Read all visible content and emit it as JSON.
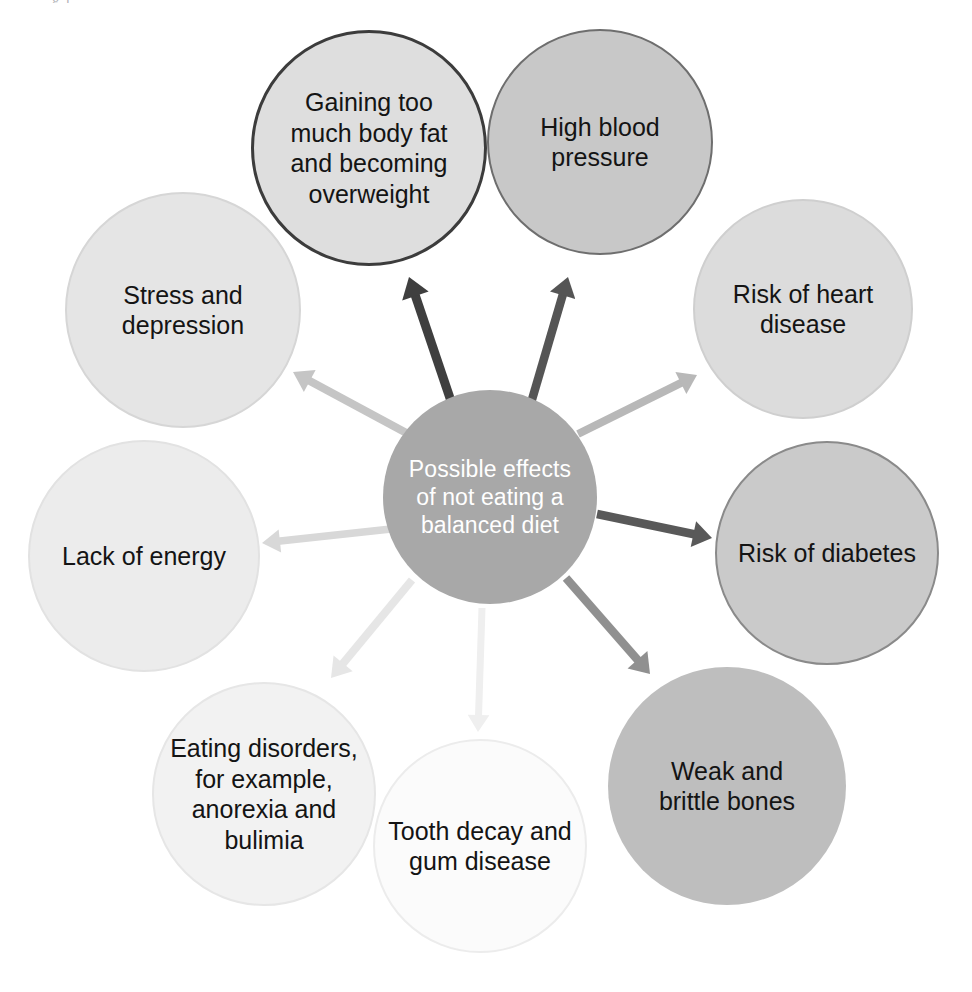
{
  "page": {
    "background": "#ffffff",
    "width": 972,
    "height": 992,
    "top_remnant": "g                                                              ı"
  },
  "diagram": {
    "type": "radial-mind-map",
    "title": "Possible effects of not eating a balanced diet",
    "center": {
      "id": "center",
      "label": "Possible effects\nof not eating a\nbalanced diet",
      "cx": 490,
      "cy": 497,
      "r": 107,
      "fill": "#a8a8a8",
      "stroke": "#a8a8a8",
      "stroke_width": 0,
      "text_color": "#ffffff",
      "font_size": 23
    },
    "nodes": [
      {
        "id": "gaining-weight",
        "label": "Gaining too\nmuch body fat\nand becoming\noverweight",
        "cx": 369,
        "cy": 148,
        "r": 118,
        "fill": "#dedede",
        "stroke": "#3c3c3c",
        "stroke_width": 3,
        "text_color": "#141414",
        "font_size": 25
      },
      {
        "id": "high-blood-pressure",
        "label": "High blood\npressure",
        "cx": 600,
        "cy": 142,
        "r": 113,
        "fill": "#c8c8c8",
        "stroke": "#6e6e6e",
        "stroke_width": 2,
        "text_color": "#141414",
        "font_size": 25
      },
      {
        "id": "heart-disease",
        "label": "Risk of heart\ndisease",
        "cx": 803,
        "cy": 309,
        "r": 110,
        "fill": "#dcdcdc",
        "stroke": "#cfcfcf",
        "stroke_width": 2,
        "text_color": "#141414",
        "font_size": 25
      },
      {
        "id": "diabetes",
        "label": "Risk of diabetes",
        "cx": 827,
        "cy": 553,
        "r": 112,
        "fill": "#cacaca",
        "stroke": "#8a8a8a",
        "stroke_width": 2,
        "text_color": "#141414",
        "font_size": 25
      },
      {
        "id": "brittle-bones",
        "label": "Weak and\nbrittle bones",
        "cx": 727,
        "cy": 786,
        "r": 119,
        "fill": "#bebebe",
        "stroke": "#bebebe",
        "stroke_width": 0,
        "text_color": "#141414",
        "font_size": 25
      },
      {
        "id": "tooth-decay",
        "label": "Tooth decay and\ngum disease",
        "cx": 480,
        "cy": 846,
        "r": 107,
        "fill": "#fbfbfb",
        "stroke": "#ececec",
        "stroke_width": 2,
        "text_color": "#141414",
        "font_size": 25
      },
      {
        "id": "eating-disorders",
        "label": "Eating disorders,\nfor example,\nanorexia and\nbulimia",
        "cx": 264,
        "cy": 794,
        "r": 112,
        "fill": "#f2f2f2",
        "stroke": "#e6e6e6",
        "stroke_width": 2,
        "text_color": "#141414",
        "font_size": 25
      },
      {
        "id": "lack-of-energy",
        "label": "Lack of energy",
        "cx": 144,
        "cy": 556,
        "r": 116,
        "fill": "#ececec",
        "stroke": "#e2e2e2",
        "stroke_width": 2,
        "text_color": "#141414",
        "font_size": 25
      },
      {
        "id": "stress-depression",
        "label": "Stress and\ndepression",
        "cx": 183,
        "cy": 310,
        "r": 118,
        "fill": "#e5e5e5",
        "stroke": "#d6d6d6",
        "stroke_width": 2,
        "text_color": "#141414",
        "font_size": 25
      }
    ],
    "arrows": [
      {
        "id": "arrow-to-gaining-weight",
        "from": "center",
        "to": "gaining-weight",
        "color": "#3f3f3f",
        "width": 9,
        "head": 20,
        "x1": 452,
        "y1": 404,
        "x2": 409,
        "y2": 277
      },
      {
        "id": "arrow-to-high-blood-pressure",
        "from": "center",
        "to": "high-blood-pressure",
        "color": "#555555",
        "width": 8.5,
        "head": 19,
        "x1": 531,
        "y1": 403,
        "x2": 568,
        "y2": 277
      },
      {
        "id": "arrow-to-heart-disease",
        "from": "center",
        "to": "heart-disease",
        "color": "#b8b8b8",
        "width": 8,
        "head": 18,
        "x1": 578,
        "y1": 434,
        "x2": 697,
        "y2": 375
      },
      {
        "id": "arrow-to-diabetes",
        "from": "center",
        "to": "diabetes",
        "color": "#595959",
        "width": 8.5,
        "head": 19,
        "x1": 597,
        "y1": 514,
        "x2": 712,
        "y2": 538
      },
      {
        "id": "arrow-to-brittle-bones",
        "from": "center",
        "to": "brittle-bones",
        "color": "#909090",
        "width": 8.5,
        "head": 19,
        "x1": 566,
        "y1": 578,
        "x2": 650,
        "y2": 674
      },
      {
        "id": "arrow-to-tooth-decay",
        "from": "center",
        "to": "tooth-decay",
        "color": "#efefef",
        "width": 7,
        "head": 17,
        "x1": 482,
        "y1": 608,
        "x2": 478,
        "y2": 732
      },
      {
        "id": "arrow-to-eating-disorders",
        "from": "center",
        "to": "eating-disorders",
        "color": "#e6e6e6",
        "width": 8,
        "head": 19,
        "x1": 412,
        "y1": 580,
        "x2": 331,
        "y2": 678
      },
      {
        "id": "arrow-to-lack-of-energy",
        "from": "center",
        "to": "lack-of-energy",
        "color": "#d8d8d8",
        "width": 7.5,
        "head": 18,
        "x1": 391,
        "y1": 529,
        "x2": 262,
        "y2": 543
      },
      {
        "id": "arrow-to-stress-depression",
        "from": "center",
        "to": "stress-depression",
        "color": "#c5c5c5",
        "width": 8,
        "head": 19,
        "x1": 412,
        "y1": 436,
        "x2": 293,
        "y2": 372
      }
    ]
  }
}
